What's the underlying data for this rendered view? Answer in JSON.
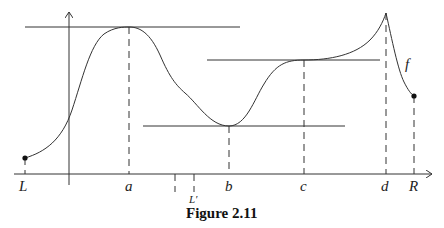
{
  "figure": {
    "caption": "Figure 2.11",
    "function_label": "f",
    "x_labels": {
      "L": "L",
      "a": "a",
      "L_prime": "L′",
      "b": "b",
      "c": "c",
      "d": "d",
      "R": "R"
    }
  },
  "colors": {
    "stroke": "#333333",
    "text": "#222222",
    "background": "#ffffff"
  }
}
